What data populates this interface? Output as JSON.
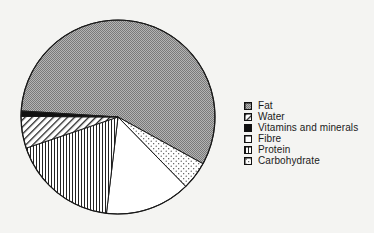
{
  "chart_data": {
    "type": "pie",
    "title": "",
    "units": "percent (estimated from slice angles)",
    "start_angle_deg": 273.6,
    "direction": "clockwise",
    "slices": [
      {
        "label": "Fat",
        "value": 57.0,
        "pattern": "crosshatch-grey"
      },
      {
        "label": "Carbohydrate",
        "value": 4.7,
        "pattern": "dots"
      },
      {
        "label": "Fibre",
        "value": 14.2,
        "pattern": "white"
      },
      {
        "label": "Protein",
        "value": 17.9,
        "pattern": "vertical-lines"
      },
      {
        "label": "Water",
        "value": 5.3,
        "pattern": "diagonal-lines"
      },
      {
        "label": "Vitamins and minerals",
        "value": 0.9,
        "pattern": "solid-black"
      }
    ],
    "legend": {
      "position": "right",
      "entries": [
        {
          "label": "Fat",
          "pattern": "crosshatch-grey"
        },
        {
          "label": "Water",
          "pattern": "diagonal-lines"
        },
        {
          "label": "Vitamins and minerals",
          "pattern": "solid-black"
        },
        {
          "label": "Fibre",
          "pattern": "white"
        },
        {
          "label": "Protein",
          "pattern": "vertical-lines"
        },
        {
          "label": "Carbohydrate",
          "pattern": "dots"
        }
      ]
    },
    "geometry": {
      "cx": 118,
      "cy": 117,
      "r": 97
    }
  },
  "colors": {
    "background": "#f4f4f2",
    "outline": "#1a1a1a",
    "fat_fill": "#9a9a9a",
    "white": "#ffffff",
    "black": "#111111"
  }
}
